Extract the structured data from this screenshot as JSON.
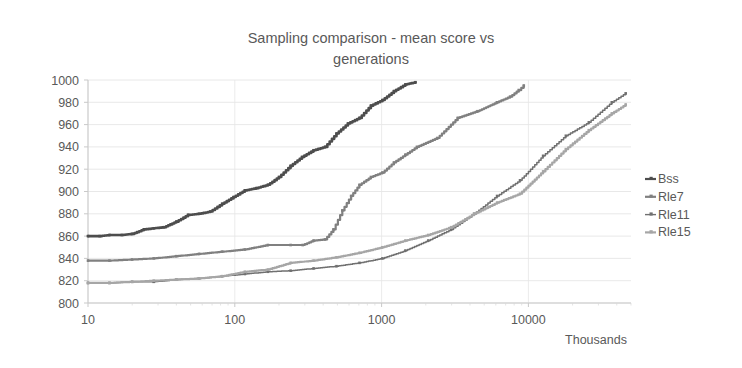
{
  "chart": {
    "title": "Sampling comparison - mean score vs\ngenerations",
    "xlabel": "Thousands",
    "ylabel": ""
  },
  "chart_data": {
    "type": "line",
    "title": "Sampling comparison - mean score vs generations",
    "subtitle": "",
    "xlabel": "Thousands",
    "ylabel": "",
    "xscale": "log",
    "xlim": [
      10,
      50000
    ],
    "ylim": [
      800,
      1000
    ],
    "xticks": [
      10,
      100,
      1000,
      10000
    ],
    "xticklabels": [
      "10",
      "100",
      "1000",
      "10000"
    ],
    "yticks": [
      800,
      820,
      840,
      860,
      880,
      900,
      920,
      940,
      960,
      980,
      1000
    ],
    "yticklabels": [
      "800",
      "820",
      "840",
      "860",
      "880",
      "900",
      "920",
      "940",
      "960",
      "980",
      "1000"
    ],
    "grid": true,
    "legend_position": "right",
    "markers": true,
    "series": [
      {
        "name": "Bss",
        "color": "#4d4d4d",
        "width": 2.6,
        "x": [
          10,
          12,
          14,
          17,
          20,
          24,
          28,
          33,
          40,
          48,
          57,
          68,
          82,
          98,
          117,
          140,
          168,
          200,
          240,
          287,
          344,
          412,
          493,
          590,
          707,
          846,
          1013,
          1213,
          1452,
          1700
        ],
        "y": [
          860,
          860,
          861,
          861,
          862,
          866,
          867,
          868,
          873,
          879,
          880,
          882,
          889,
          895,
          901,
          903,
          906,
          913,
          923,
          931,
          937,
          940,
          952,
          961,
          966,
          977,
          982,
          990,
          996,
          998
        ]
      },
      {
        "name": "Rle7",
        "color": "#808080",
        "width": 2.2,
        "x": [
          10,
          14,
          20,
          28,
          40,
          57,
          82,
          117,
          168,
          240,
          290,
          344,
          412,
          470,
          540,
          620,
          707,
          846,
          1013,
          1213,
          1452,
          1740,
          2400,
          3300,
          4500,
          6100,
          7500,
          8600,
          9300
        ],
        "y": [
          838,
          838,
          839,
          840,
          842,
          844,
          846,
          848,
          852,
          852,
          852,
          856,
          857,
          866,
          883,
          896,
          906,
          913,
          917,
          926,
          933,
          940,
          948,
          966,
          972,
          980,
          985,
          991,
          995
        ]
      },
      {
        "name": "Rle11",
        "color": "#707070",
        "width": 1.5,
        "x": [
          10,
          14,
          20,
          28,
          40,
          57,
          82,
          117,
          168,
          240,
          344,
          493,
          707,
          1013,
          1452,
          2080,
          2980,
          4270,
          6120,
          8770,
          12600,
          18000,
          25800,
          37000,
          46000
        ],
        "y": [
          818,
          818,
          819,
          819,
          821,
          822,
          824,
          826,
          828,
          829,
          831,
          833,
          836,
          840,
          847,
          856,
          866,
          880,
          896,
          910,
          932,
          950,
          962,
          980,
          988
        ]
      },
      {
        "name": "Rle15",
        "color": "#a6a6a6",
        "width": 2.2,
        "x": [
          10,
          14,
          20,
          28,
          40,
          57,
          82,
          117,
          168,
          240,
          344,
          493,
          707,
          1013,
          1452,
          2080,
          2980,
          4270,
          6120,
          8770,
          12600,
          18000,
          25800,
          37000,
          46000
        ],
        "y": [
          818,
          818,
          819,
          820,
          821,
          822,
          824,
          828,
          830,
          836,
          838,
          841,
          845,
          850,
          856,
          861,
          868,
          880,
          890,
          898,
          918,
          938,
          955,
          970,
          978
        ]
      }
    ],
    "legend": [
      {
        "label": "Bss",
        "color": "#4d4d4d"
      },
      {
        "label": "Rle7",
        "color": "#808080"
      },
      {
        "label": "Rle11",
        "color": "#707070"
      },
      {
        "label": "Rle15",
        "color": "#a6a6a6"
      }
    ]
  }
}
